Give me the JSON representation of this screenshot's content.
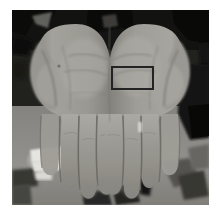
{
  "figure": {
    "name": "palms-photograph",
    "description": "Grayscale photograph of two open human hands, palms facing the camera, fingers pointing downward",
    "caption": "",
    "page_background": "#ffffff",
    "margins": {
      "left": 12,
      "top": 10,
      "right": 13,
      "bottom": 14
    }
  },
  "photo": {
    "width": 197,
    "height": 195,
    "color_mode": "grayscale",
    "palette": {
      "background_dark": "#1b1b1b",
      "background_darkest": "#0d0d0d",
      "skin_light": "#b9b7b2",
      "skin_mid": "#9b9992",
      "skin_shadow": "#7d7b76",
      "crease_dark": "#6a6864",
      "surface_gray": "#8e8d89",
      "highlight_white": "#f4f3ef",
      "edge_gray": "#56554f"
    }
  },
  "annotation": {
    "type": "region-of-interest-rectangle",
    "label": "",
    "stroke_color": "#232323",
    "stroke_width": 2,
    "x": 99,
    "y": 56,
    "width": 43,
    "height": 24
  },
  "subjects": [
    {
      "name": "left-hand",
      "side": "left",
      "visible_parts": [
        "thumb",
        "palm",
        "index",
        "middle",
        "ring",
        "little"
      ]
    },
    {
      "name": "right-hand",
      "side": "right",
      "visible_parts": [
        "thumb",
        "palm",
        "index",
        "middle",
        "ring",
        "little"
      ]
    }
  ]
}
